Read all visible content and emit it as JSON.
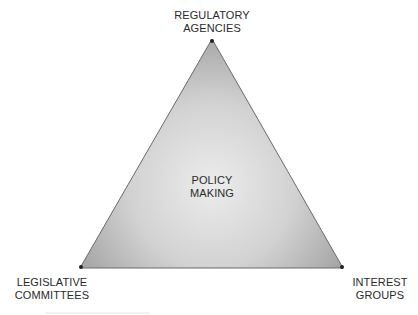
{
  "diagram": {
    "type": "iron-triangle",
    "center": {
      "line1": "POLICY",
      "line2": "MAKING"
    },
    "vertices": {
      "top": {
        "line1": "REGULATORY",
        "line2": "AGENCIES"
      },
      "bottom_left": {
        "line1": "LEGISLATIVE",
        "line2": "COMMITTEES"
      },
      "bottom_right": {
        "line1": "INTEREST",
        "line2": "GROUPS"
      }
    },
    "colors": {
      "fill_center": "#ebebeb",
      "fill_edge": "#a9a9a9",
      "stroke": "#555555",
      "vertex_dot": "#222222"
    }
  }
}
